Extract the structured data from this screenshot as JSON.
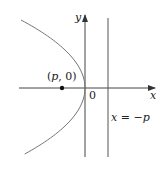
{
  "diagram": {
    "type": "parabola-with-directrix",
    "axes": {
      "x_label": "x",
      "y_label": "y",
      "origin_label": "0"
    },
    "focus": {
      "label": "(p, 0)",
      "label_parts": {
        "open": "(",
        "var": "p",
        "rest": ", 0)"
      }
    },
    "directrix": {
      "label": "x = −p",
      "label_parts": {
        "lhs": "x",
        "eq": " = −",
        "rhs": "p"
      }
    },
    "colors": {
      "axes": "#333333",
      "curve": "#777777",
      "point": "#111111"
    }
  }
}
